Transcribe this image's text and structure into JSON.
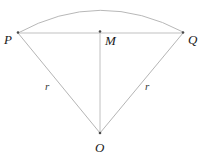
{
  "figure": {
    "type": "circular-sector-diagram",
    "canvas": {
      "width": 210,
      "height": 168,
      "background": "#ffffff"
    },
    "stroke": {
      "color": "#b5b5b5",
      "chord_color": "#d2d2d2",
      "width": 1
    },
    "point_marker": {
      "color": "#555555",
      "radius": 1.2
    },
    "points": [
      {
        "id": "P",
        "label": "P",
        "x": 18,
        "y": 33,
        "label_x": 4,
        "label_y": 33
      },
      {
        "id": "M",
        "label": "M",
        "x": 100,
        "y": 33,
        "label_x": 105,
        "label_y": 34
      },
      {
        "id": "Q",
        "label": "Q",
        "x": 183,
        "y": 33,
        "label_x": 188,
        "label_y": 33
      },
      {
        "id": "O",
        "label": "O",
        "x": 100,
        "y": 133,
        "label_x": 95,
        "label_y": 141
      }
    ],
    "segments": [
      {
        "id": "chord-PQ",
        "from": "P",
        "to": "Q",
        "label": ""
      },
      {
        "id": "radius-PO",
        "from": "P",
        "to": "O",
        "label": "r"
      },
      {
        "id": "radius-QO",
        "from": "Q",
        "to": "O",
        "label": "r"
      },
      {
        "id": "apothem-MO",
        "from": "M",
        "to": "O",
        "label": ""
      }
    ],
    "arc": {
      "id": "arc-PQ",
      "from": "P",
      "to": "Q",
      "apex_x": 100,
      "apex_y": 3,
      "path": "M 18 33 Q 100 -12 183 32"
    },
    "measure_labels": [
      {
        "id": "r-left",
        "text": "r",
        "x": 45,
        "y": 81
      },
      {
        "id": "r-right",
        "text": "r",
        "x": 145,
        "y": 81
      }
    ]
  }
}
